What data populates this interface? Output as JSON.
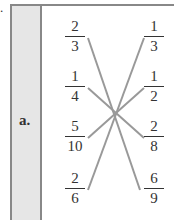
{
  "prefix": ".",
  "problem_label": "a.",
  "left_fractions": [
    {
      "num": "2",
      "den": "3"
    },
    {
      "num": "1",
      "den": "4"
    },
    {
      "num": "5",
      "den": "10"
    },
    {
      "num": "2",
      "den": "6"
    }
  ],
  "right_fractions": [
    {
      "num": "1",
      "den": "3"
    },
    {
      "num": "1",
      "den": "2"
    },
    {
      "num": "2",
      "den": "8"
    },
    {
      "num": "6",
      "den": "9"
    }
  ],
  "line_color": "#999999"
}
